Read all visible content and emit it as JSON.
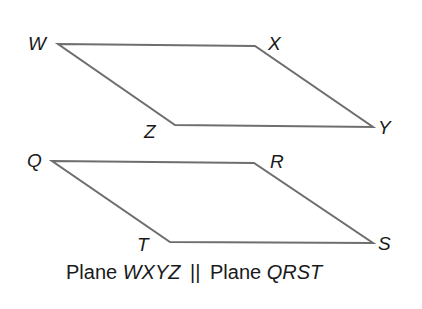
{
  "diagram": {
    "planes": [
      {
        "name": "WXYZ",
        "vertices": [
          {
            "label": "W",
            "x": 58,
            "y": 44
          },
          {
            "label": "X",
            "x": 255,
            "y": 46
          },
          {
            "label": "Y",
            "x": 373,
            "y": 127
          },
          {
            "label": "Z",
            "x": 175,
            "y": 125
          }
        ]
      },
      {
        "name": "QRST",
        "vertices": [
          {
            "label": "Q",
            "x": 52,
            "y": 161
          },
          {
            "label": "R",
            "x": 254,
            "y": 163
          },
          {
            "label": "S",
            "x": 373,
            "y": 243
          },
          {
            "label": "T",
            "x": 170,
            "y": 242
          }
        ]
      }
    ],
    "labels": {
      "W": "W",
      "X": "X",
      "Y": "Y",
      "Z": "Z",
      "Q": "Q",
      "R": "R",
      "S": "S",
      "T": "T"
    },
    "caption": {
      "word1": "Plane",
      "plane1": "WXYZ",
      "parallel_symbol": "||",
      "word2": "Plane",
      "plane2": "QRST"
    },
    "colors": {
      "edge": "#6e6e6e",
      "text": "#1a1a1a",
      "background": "#ffffff"
    }
  }
}
